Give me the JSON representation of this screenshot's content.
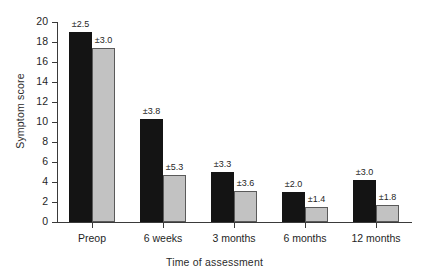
{
  "chart_data": {
    "type": "bar",
    "title": "",
    "xlabel": "Time of assessment",
    "ylabel": "Symptom score",
    "ylim": [
      0,
      20
    ],
    "ytick_step": 2,
    "yticks": [
      0,
      2,
      4,
      6,
      8,
      10,
      12,
      14,
      16,
      18,
      20
    ],
    "ytick_labels": [
      "0",
      "2",
      "4",
      "6",
      "8",
      "10",
      "12",
      "14",
      "16",
      "18",
      "20"
    ],
    "grid": false,
    "legend": null,
    "legend_position": "none",
    "categories": [
      "Preop",
      "6 weeks",
      "3 months",
      "6 months",
      "12 months"
    ],
    "series": [
      {
        "name": "series-dark",
        "color": "#141414",
        "values": [
          19.0,
          10.3,
          5.0,
          3.0,
          4.25
        ],
        "error_labels": [
          "±2.5",
          "±3.8",
          "±3.3",
          "±2.0",
          "±3.0"
        ],
        "errors": [
          2.5,
          3.8,
          3.3,
          2.0,
          3.0
        ]
      },
      {
        "name": "series-light",
        "color": "#c2c2c2",
        "values": [
          17.4,
          4.7,
          3.15,
          1.55,
          1.7
        ],
        "error_labels": [
          "±3.0",
          "±5.3",
          "±3.6",
          "±1.4",
          "±1.8"
        ],
        "errors": [
          3.0,
          5.3,
          3.6,
          1.4,
          1.8
        ]
      }
    ]
  },
  "colors": {
    "dark_bar": "#141414",
    "light_bar": "#c2c2c2",
    "axis": "#3a3a3a",
    "background": "#ffffff",
    "text": "#1f1f1f"
  }
}
